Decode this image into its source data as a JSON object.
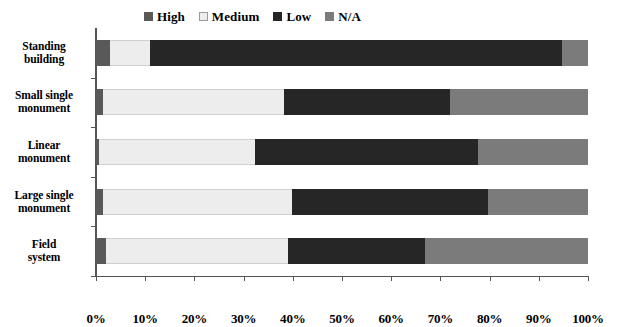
{
  "chart_data": {
    "type": "bar",
    "orientation": "horizontal",
    "stacked": true,
    "stack_mode": "percent",
    "title": "",
    "xlabel": "",
    "ylabel": "",
    "xlim": [
      0,
      100
    ],
    "grid": false,
    "legend_position": "top",
    "categories": [
      "Standing building",
      "Small single monument",
      "Linear monument",
      "Large single monument",
      "Field system"
    ],
    "category_lines": [
      [
        "Standing",
        "building"
      ],
      [
        "Small single",
        "monument"
      ],
      [
        "Linear",
        "monument"
      ],
      [
        "Large single",
        "monument"
      ],
      [
        "Field",
        "system"
      ]
    ],
    "x_tick_labels": [
      "0%",
      "10%",
      "20%",
      "30%",
      "40%",
      "50%",
      "60%",
      "70%",
      "80%",
      "90%",
      "100%"
    ],
    "x_tick_values": [
      0,
      10,
      20,
      30,
      40,
      50,
      60,
      70,
      80,
      90,
      100
    ],
    "series": [
      {
        "name": "High",
        "color": "#595959",
        "values": [
          2.8,
          1.4,
          0.7,
          1.4,
          2.0
        ]
      },
      {
        "name": "Medium",
        "color": "#ededed",
        "values": [
          8.2,
          36.8,
          31.6,
          38.4,
          37.0
        ]
      },
      {
        "name": "Low",
        "color": "#262626",
        "values": [
          83.7,
          33.8,
          45.3,
          39.9,
          27.8
        ]
      },
      {
        "name": "N/A",
        "color": "#7b7b7b",
        "values": [
          5.3,
          28.0,
          22.4,
          20.3,
          33.2
        ]
      }
    ]
  },
  "legend": {
    "items": [
      {
        "label": "High",
        "color": "#595959"
      },
      {
        "label": "Medium",
        "color": "#ededed"
      },
      {
        "label": "Low",
        "color": "#262626"
      },
      {
        "label": "N/A",
        "color": "#7b7b7b"
      }
    ]
  },
  "style": {
    "axis_color": "#555555",
    "background": "#ffffff",
    "segment_border": "#ffffff"
  }
}
